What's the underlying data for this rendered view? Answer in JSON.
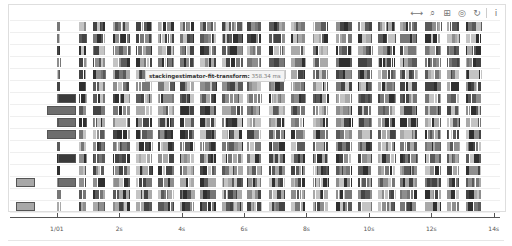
{
  "toolbar": {
    "tools": [
      {
        "name": "pan-tool",
        "glyph": "⟷"
      },
      {
        "name": "wheel-zoom-tool",
        "glyph": "⌕"
      },
      {
        "name": "box-zoom-tool",
        "glyph": "⊞"
      },
      {
        "name": "save-tool",
        "glyph": "◎"
      },
      {
        "name": "reset-tool",
        "glyph": "↻"
      },
      {
        "name": "help-tool",
        "glyph": "i"
      }
    ]
  },
  "tooltip": {
    "name": "stackingestimator-fit-transform:",
    "value": "358.34 ms"
  },
  "chart_data": {
    "type": "timeline",
    "title": "",
    "xlabel": "",
    "ylabel": "",
    "x_ticks": [
      "1/01",
      "2s",
      "4s",
      "6s",
      "8s",
      "10s",
      "12s",
      "14s"
    ],
    "x_tick_positions_s": [
      0,
      2,
      4,
      6,
      8,
      10,
      12,
      14
    ],
    "xlim_s": [
      -1.5,
      14.2
    ],
    "rows": 16,
    "grid": true,
    "legend": null,
    "colors": {
      "dark": "#3a3a3a",
      "mid": "#6e6e6e",
      "light": "#a8a8a8",
      "highlight": "#555555"
    },
    "notable_tasks": [
      {
        "row": 13,
        "start_s": -1.3,
        "end_s": -0.7,
        "shade": "light"
      },
      {
        "row": 15,
        "start_s": -1.3,
        "end_s": -0.7,
        "shade": "light"
      },
      {
        "row": 6,
        "start_s": 0.05,
        "end_s": 0.6,
        "shade": "dark"
      },
      {
        "row": 7,
        "start_s": -0.3,
        "end_s": 0.6,
        "shade": "mid"
      },
      {
        "row": 8,
        "start_s": 0.05,
        "end_s": 0.6,
        "shade": "mid"
      },
      {
        "row": 9,
        "start_s": -0.3,
        "end_s": 0.6,
        "shade": "mid"
      },
      {
        "row": 11,
        "start_s": 0.05,
        "end_s": 0.6,
        "shade": "dark"
      },
      {
        "row": 13,
        "start_s": 0.05,
        "end_s": 0.6,
        "shade": "mid"
      }
    ],
    "task_bands_s": [
      [
        0.0,
        0.1
      ],
      [
        0.7,
        0.95
      ],
      [
        1.15,
        1.55
      ],
      [
        1.8,
        2.35
      ],
      [
        2.55,
        3.05
      ],
      [
        3.25,
        3.75
      ],
      [
        3.95,
        4.4
      ],
      [
        4.6,
        5.1
      ],
      [
        5.3,
        5.95
      ],
      [
        6.1,
        6.55
      ],
      [
        6.8,
        7.3
      ],
      [
        7.5,
        7.95
      ],
      [
        8.2,
        8.7
      ],
      [
        8.95,
        9.45
      ],
      [
        9.65,
        10.1
      ],
      [
        10.3,
        10.85
      ],
      [
        11.0,
        11.55
      ],
      [
        11.8,
        12.3
      ],
      [
        12.5,
        12.9
      ],
      [
        13.1,
        13.6
      ]
    ]
  }
}
